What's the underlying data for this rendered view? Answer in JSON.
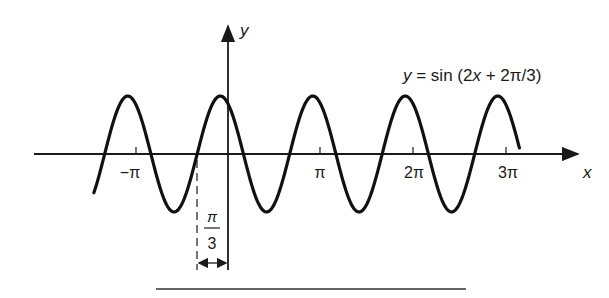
{
  "figure": {
    "equation_label": "y = sin (2x + 2π/3)",
    "equation_parts": {
      "y": "y",
      "eq": " = sin (2",
      "x": "x",
      "rest": " + 2π/3)"
    },
    "x_axis_label": "x",
    "y_axis_label": "y",
    "x_tick_labels": [
      "−π",
      "π",
      "2π",
      "3π"
    ],
    "shift_annotation": {
      "numerator": "π",
      "denominator": "3"
    },
    "colors": {
      "ink": "#1a1a1a",
      "background": "#ffffff"
    }
  },
  "chart_data": {
    "type": "line",
    "title": "y = sin (2x + 2π/3)",
    "xlabel": "x",
    "ylabel": "y",
    "function": "sin(2x + 2*pi/3)",
    "x_range": [
      -1.45,
      3.15
    ],
    "x_range_units": "multiples of pi",
    "y_range": [
      -1,
      1
    ],
    "x_ticks": [
      {
        "value": "-pi",
        "label": "−π"
      },
      {
        "value": "pi",
        "label": "π"
      },
      {
        "value": "2pi",
        "label": "2π"
      },
      {
        "value": "3pi",
        "label": "3π"
      }
    ],
    "annotations": [
      {
        "type": "dashed-line",
        "x": "-pi/3",
        "note": "phase shift marker"
      },
      {
        "type": "dimension-arrow",
        "from": "-pi/3",
        "to": "0",
        "label": "π/3"
      }
    ],
    "grid": false,
    "legend": "none"
  }
}
